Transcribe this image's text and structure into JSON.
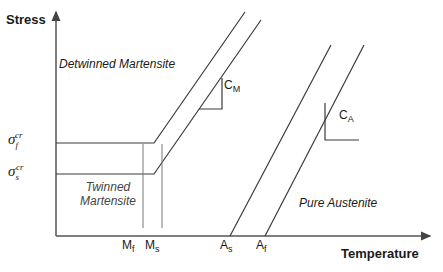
{
  "axes": {
    "y_label": "Stress",
    "x_label": "Temperature"
  },
  "stress_levels": {
    "sigma_f": {
      "base": "σ",
      "sub": "f",
      "sup": "cr"
    },
    "sigma_s": {
      "base": "σ",
      "sub": "s",
      "sup": "cr"
    }
  },
  "regions": {
    "detwinned": "Detwinned Martensite",
    "twinned_line1": "Twinned",
    "twinned_line2": "Martensite",
    "austenite": "Pure Austenite"
  },
  "temperatures": {
    "mf": {
      "base": "M",
      "sub": "f"
    },
    "ms": {
      "base": "M",
      "sub": "s"
    },
    "as": {
      "base": "A",
      "sub": "s"
    },
    "af": {
      "base": "A",
      "sub": "f"
    }
  },
  "slopes": {
    "cm": {
      "base": "C",
      "sub": "M"
    },
    "ca": {
      "base": "C",
      "sub": "A"
    }
  },
  "colors": {
    "line": "#3a3a3a",
    "axis": "#555555",
    "text": "#1a1a1a"
  }
}
